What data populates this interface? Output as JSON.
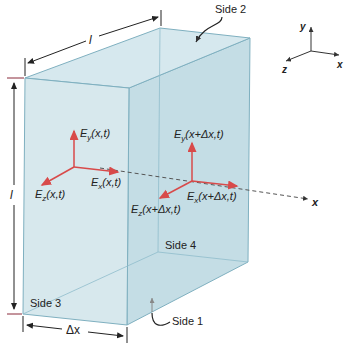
{
  "diagram": {
    "colors": {
      "box_fill": "#c9e1e8",
      "box_edge": "#7fb0c0",
      "field_arrow": "#d84a4a",
      "axis_line": "#333333",
      "dim_line": "#222222",
      "dim_tick": "#8a2a3a"
    },
    "labels": {
      "side1": "Side 1",
      "side2": "Side 2",
      "side3": "Side 3",
      "side4": "Side 4",
      "length_top": "l",
      "length_left": "l",
      "width_bottom": "Δx",
      "x_axis_dashed": "x",
      "ey_left": "E",
      "ey_left_sub": "y",
      "ey_left_arg": "(x,t)",
      "ex_left": "E",
      "ex_left_sub": "x",
      "ex_left_arg": "(x,t)",
      "ez_left": "E",
      "ez_left_sub": "z",
      "ez_left_arg": "(x,t)",
      "ey_right": "E",
      "ey_right_sub": "y",
      "ey_right_arg": "(x+Δx,t)",
      "ex_right": "E",
      "ex_right_sub": "x",
      "ex_right_arg": "(x+Δx,t)",
      "ez_right": "E",
      "ez_right_sub": "z",
      "ez_right_arg": "(x+Δx,t)"
    },
    "axes_legend": {
      "x": "x",
      "y": "y",
      "z": "z"
    }
  }
}
